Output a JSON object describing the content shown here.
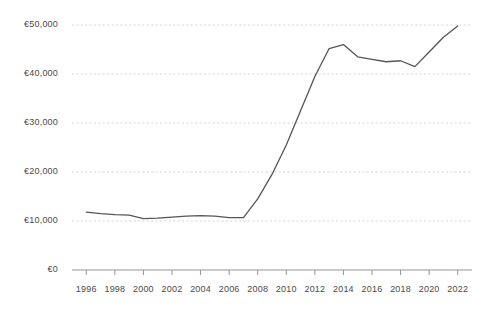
{
  "chart_data": {
    "type": "line",
    "title": "",
    "subtitle": "",
    "xlabel": "",
    "ylabel": "",
    "xlim": [
      1995,
      2023
    ],
    "ylim": [
      0,
      50000
    ],
    "grid": true,
    "legend_position": "none",
    "currency_symbol": "€",
    "line_color": "#555555",
    "grid_color": "#c8c8c8",
    "axis_color": "#8a8a8a",
    "tick_label_color": "#4a4a4a",
    "background_color": "#ffffff",
    "y_ticks": [
      0,
      10000,
      20000,
      30000,
      40000,
      50000
    ],
    "y_tick_labels": [
      "€0",
      "€10,000",
      "€20,000",
      "€30,000",
      "€40,000",
      "€50,000"
    ],
    "x_ticks": [
      1996,
      1998,
      2000,
      2002,
      2004,
      2006,
      2008,
      2010,
      2012,
      2014,
      2016,
      2018,
      2020,
      2022
    ],
    "x_tick_labels": [
      "1996",
      "1998",
      "2000",
      "2002",
      "2004",
      "2006",
      "2008",
      "2010",
      "2012",
      "2014",
      "2016",
      "2018",
      "2020",
      "2022"
    ],
    "series": [
      {
        "name": "value",
        "x": [
          1996,
          1997,
          1998,
          1999,
          2000,
          2001,
          2002,
          2003,
          2004,
          2005,
          2006,
          2007,
          2008,
          2009,
          2010,
          2011,
          2012,
          2013,
          2014,
          2015,
          2016,
          2017,
          2018,
          2019,
          2020,
          2021,
          2022
        ],
        "values": [
          11800,
          11500,
          11300,
          11200,
          10500,
          10600,
          10800,
          11000,
          11100,
          11000,
          10700,
          10700,
          14500,
          19500,
          25500,
          32500,
          39500,
          45200,
          46000,
          43500,
          43000,
          42500,
          42700,
          41500,
          44500,
          47500,
          49800
        ]
      }
    ]
  },
  "axes": {
    "y_axis_name": "euro-value-axis",
    "x_axis_name": "year-axis"
  }
}
